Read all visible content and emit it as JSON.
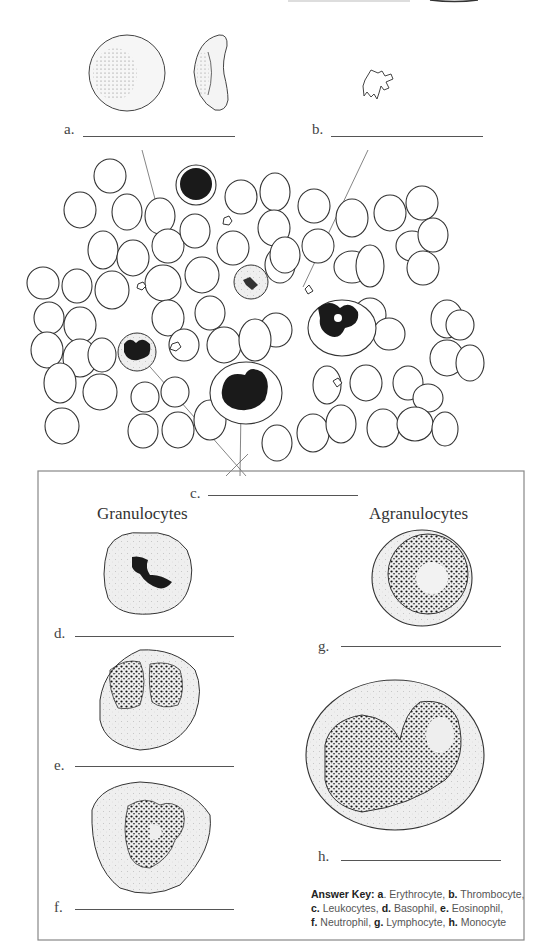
{
  "labels": {
    "a": {
      "letter": "a."
    },
    "b": {
      "letter": "b."
    },
    "c": {
      "letter": "c."
    },
    "d": {
      "letter": "d."
    },
    "e": {
      "letter": "e."
    },
    "f": {
      "letter": "f."
    },
    "g": {
      "letter": "g."
    },
    "h": {
      "letter": "h."
    }
  },
  "headings": {
    "granulocytes": "Granulocytes",
    "agranulocytes": "Agranulocytes"
  },
  "answer_key": {
    "title": "Answer Key:",
    "items": [
      {
        "letter": "a",
        "sep": ". ",
        "name": "Erythrocyte,"
      },
      {
        "letter": "b.",
        "sep": " ",
        "name": "Thrombocyte,"
      },
      {
        "letter": "c.",
        "sep": " ",
        "name": "Leukocytes,"
      },
      {
        "letter": "d.",
        "sep": " ",
        "name": "Basophil,"
      },
      {
        "letter": "e.",
        "sep": " ",
        "name": "Eosinophil,"
      },
      {
        "letter": "f.",
        "sep": " ",
        "name": "Neutrophil,"
      },
      {
        "letter": "g.",
        "sep": " ",
        "name": "Lymphocyte,"
      },
      {
        "letter": "h.",
        "sep": " ",
        "name": "Monocyte"
      }
    ]
  },
  "colors": {
    "outline": "#333333",
    "nucleus": "#1a1a1a",
    "cytoplasm": "#eeeeee",
    "frame": "#888888"
  }
}
